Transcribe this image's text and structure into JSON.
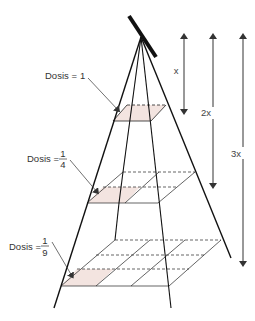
{
  "diagram": {
    "colors": {
      "shaded_area": "#f3e4e0",
      "lines": "#111111",
      "arrows": "#333333"
    },
    "labels": [
      {
        "id": "dose_1",
        "prefix": "Dosis =",
        "value": "1",
        "fraction": false
      },
      {
        "id": "dose_1_4",
        "prefix": "Dosis =",
        "numerator": "1",
        "denominator": "4",
        "fraction": true
      },
      {
        "id": "dose_1_9",
        "prefix": "Dosis =",
        "numerator": "1",
        "denominator": "9",
        "fraction": true
      }
    ],
    "distances": [
      {
        "id": "dist_x",
        "label": "x"
      },
      {
        "id": "dist_2x",
        "label": "2x"
      },
      {
        "id": "dist_3x",
        "label": "3x"
      }
    ],
    "grids": [
      {
        "id": "plane_1",
        "cells": "1x1"
      },
      {
        "id": "plane_2",
        "cells": "2x2"
      },
      {
        "id": "plane_3",
        "cells": "3x3"
      }
    ]
  }
}
